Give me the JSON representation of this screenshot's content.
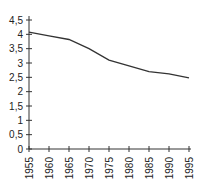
{
  "chart_data": {
    "type": "line",
    "title": "",
    "xlabel": "",
    "ylabel": "",
    "x": [
      1955,
      1960,
      1965,
      1970,
      1975,
      1980,
      1985,
      1990,
      1995
    ],
    "series": [
      {
        "name": "series",
        "values": [
          4.08,
          3.95,
          3.82,
          3.5,
          3.1,
          2.9,
          2.7,
          2.62,
          2.48
        ]
      }
    ],
    "xlim": [
      1955,
      1995
    ],
    "ylim": [
      0,
      4.5
    ],
    "y_ticks": [
      "0",
      "0,5",
      "1",
      "1,5",
      "2",
      "2,5",
      "3",
      "3,5",
      "4",
      "4,5"
    ],
    "x_ticks": [
      "1955",
      "1960",
      "1965",
      "1970",
      "1975",
      "1980",
      "1985",
      "1990",
      "1995"
    ],
    "grid": false,
    "legend": "none",
    "line_color": "#333333"
  }
}
